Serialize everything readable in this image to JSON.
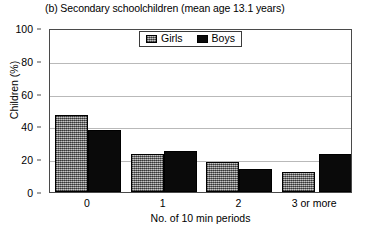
{
  "chart_data": {
    "type": "bar",
    "title": "(b) Secondary schoolchildren (mean age 13.1 years)",
    "xlabel": "No. of 10 min periods",
    "ylabel": "Children (%)",
    "categories": [
      "0",
      "1",
      "2",
      "3 or more"
    ],
    "series": [
      {
        "name": "Girls",
        "values": [
          47,
          23,
          18,
          12
        ],
        "color": "#8a8a8a",
        "fill": "checkerboard-gray"
      },
      {
        "name": "Boys",
        "values": [
          38,
          25,
          14,
          23
        ],
        "color": "#000000",
        "fill": "solid-black"
      }
    ],
    "ylim": [
      0,
      100
    ],
    "yticks": [
      0,
      20,
      40,
      60,
      80,
      100
    ],
    "ytick_labels": [
      "0",
      "20",
      "40",
      "60",
      "80",
      "100"
    ],
    "grid": "horizontal",
    "legend_position": "top-center-inside"
  }
}
